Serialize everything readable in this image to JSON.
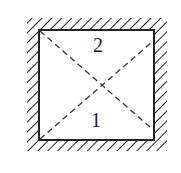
{
  "diagram": {
    "type": "enclosure-with-diagonals",
    "labels": {
      "top_region": "2",
      "bottom_region": "1"
    },
    "colors": {
      "line": "#222222",
      "hatch": "#222222",
      "background": "#ffffff"
    }
  }
}
